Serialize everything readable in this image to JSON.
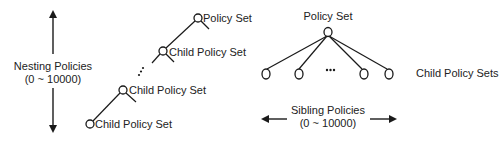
{
  "colors": {
    "stroke": "#1a1a1a",
    "text": "#222222",
    "background": "#ffffff"
  },
  "nesting": {
    "axis_label": "Nesting Policies",
    "axis_range": "(0 ~ 10000)",
    "nodes": [
      {
        "label": "Policy Set"
      },
      {
        "label": "Child Policy Set"
      },
      {
        "label": "Child Policy Set"
      },
      {
        "label": "Child Policy Set"
      }
    ],
    "ellipsis": "⋮"
  },
  "sibling": {
    "root_label": "Policy Set",
    "children_label": "Child Policy Sets",
    "ellipsis": "•••",
    "axis_label": "Sibling Policies",
    "axis_range": "(0 ~ 10000)"
  }
}
